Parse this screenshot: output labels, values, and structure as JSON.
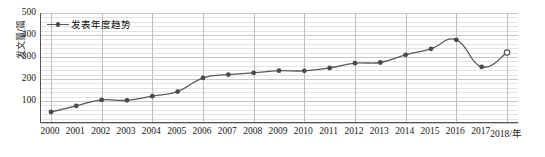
{
  "chart_data": {
    "type": "line",
    "title": "",
    "xlabel": "2018/年",
    "ylabel": "发文量/篇",
    "legend": [
      "发表年度趋势"
    ],
    "legend_position": "top-left-inside",
    "grid": true,
    "ylim": [
      0,
      500
    ],
    "yticks": [
      0,
      100,
      200,
      300,
      400,
      500
    ],
    "ytick_labels": [
      "",
      "100",
      "200",
      "300",
      "400",
      "500"
    ],
    "categories": [
      "2000",
      "2001",
      "2002",
      "2003",
      "2004",
      "2005",
      "2006",
      "2007",
      "2008",
      "2009",
      "2010",
      "2011",
      "2012",
      "2013",
      "2014",
      "2015",
      "2016",
      "2017",
      "2018"
    ],
    "xtick_labels": [
      "2000",
      "2001",
      "2002",
      "2003",
      "2004",
      "2005",
      "2006",
      "2007",
      "2008",
      "2009",
      "2010",
      "2011",
      "2012",
      "2013",
      "2014",
      "2015",
      "2016",
      "2017",
      "2018/年"
    ],
    "series": [
      {
        "name": "发表年度趋势",
        "values": [
          50,
          78,
          105,
          103,
          122,
          143,
          205,
          220,
          228,
          238,
          237,
          250,
          272,
          275,
          310,
          337,
          378,
          255,
          320
        ],
        "marker": "circle",
        "color": "#4a4a4a",
        "open_markers": [
          18
        ]
      }
    ]
  },
  "colors": {
    "line": "#5a5a5a",
    "marker": "#4a4a4a",
    "axis": "#555555",
    "grid_major": "#c8c8c8",
    "grid_minor": "#e4e4e4",
    "background": "#ffffff"
  }
}
